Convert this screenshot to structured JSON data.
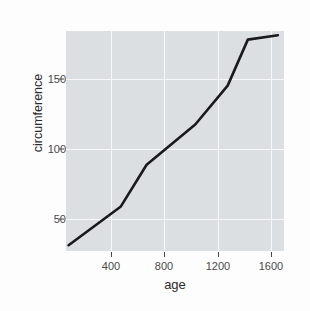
{
  "chart_data": {
    "type": "line",
    "title": "",
    "xlabel": "age",
    "ylabel": "circumference",
    "xlim": [
      100,
      1625
    ],
    "ylim": [
      27,
      180
    ],
    "grid": true,
    "legend": false,
    "legend_position": "none",
    "xticks": [
      400,
      800,
      1200,
      1600
    ],
    "xtick_labels": [
      "400",
      "800",
      "1200",
      "1600"
    ],
    "yticks": [
      50,
      100,
      150
    ],
    "ytick_labels": [
      "50",
      "100",
      "150"
    ],
    "series": [
      {
        "name": "circumference",
        "color": "#1a1a1a",
        "x": [
          118,
          484,
          664,
          1004,
          1231,
          1372,
          1582
        ],
        "y": [
          31,
          58,
          87,
          115,
          142,
          174,
          177
        ]
      }
    ],
    "points": [
      {
        "age": 118,
        "circumference": 31
      },
      {
        "age": 484,
        "circumference": 58
      },
      {
        "age": 664,
        "circumference": 87
      },
      {
        "age": 1004,
        "circumference": 115
      },
      {
        "age": 1231,
        "circumference": 142
      },
      {
        "age": 1372,
        "circumference": 174
      },
      {
        "age": 1582,
        "circumference": 177
      }
    ]
  },
  "style": {
    "panel_fill": "#dcdfe2",
    "grid_color": "#f7f8f9",
    "line_color": "#1a1a1a",
    "tick_text_color": "#4a4a4a",
    "axis_title_color": "#2b2b2b",
    "page_background": "#fdfdfd"
  }
}
